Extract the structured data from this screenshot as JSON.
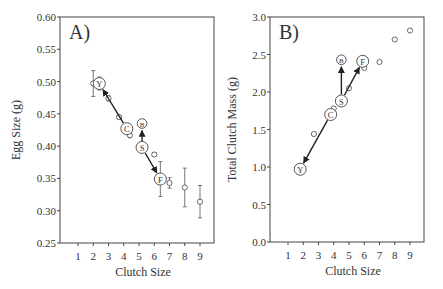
{
  "chart_data": [
    {
      "type": "scatter",
      "panel_label": "A)",
      "title": "",
      "xlabel": "Clutch Size",
      "ylabel": "Egg Size (g)",
      "xlim": [
        0,
        10
      ],
      "ylim": [
        0.25,
        0.6
      ],
      "x_ticks": [
        "1",
        "2",
        "3",
        "4",
        "5",
        "6",
        "7",
        "8",
        "9"
      ],
      "y_ticks": [
        "0.25",
        "0.30",
        "0.35",
        "0.40",
        "0.45",
        "0.50",
        "0.55",
        "0.60"
      ],
      "grid": false,
      "points": [
        {
          "x": 2.0,
          "y": 0.497,
          "err": 0.02
        },
        {
          "x": 3.0,
          "y": 0.474,
          "err": 0.004
        },
        {
          "x": 3.7,
          "y": 0.445,
          "err": 0.002
        },
        {
          "x": 4.4,
          "y": 0.417,
          "err": 0.004
        },
        {
          "x": 6.0,
          "y": 0.387,
          "err": 0.003
        },
        {
          "x": 7.0,
          "y": 0.343,
          "err": 0.008
        },
        {
          "x": 8.0,
          "y": 0.336,
          "err": 0.03
        },
        {
          "x": 9.0,
          "y": 0.314,
          "err": 0.025
        }
      ],
      "labeled_points": [
        {
          "label": "Y",
          "x": 2.4,
          "y": 0.497,
          "err": 0.01
        },
        {
          "label": "C",
          "x": 4.2,
          "y": 0.427,
          "err": 0.004
        },
        {
          "label": "B",
          "x": 5.2,
          "y": 0.435,
          "err": 0
        },
        {
          "label": "S",
          "x": 5.2,
          "y": 0.398,
          "err": 0
        },
        {
          "label": "F",
          "x": 6.4,
          "y": 0.349,
          "err": 0.027
        }
      ],
      "arrows": [
        {
          "from": "C",
          "to": "Y"
        },
        {
          "from": "S",
          "to": "F"
        },
        {
          "from": "S",
          "to": "B"
        }
      ]
    },
    {
      "type": "scatter",
      "panel_label": "B)",
      "title": "",
      "xlabel": "Clutch Size",
      "ylabel": "Total Clutch Mass (g)",
      "xlim": [
        0,
        10
      ],
      "ylim": [
        0.0,
        3.0
      ],
      "x_ticks": [
        "1",
        "2",
        "3",
        "4",
        "5",
        "6",
        "7",
        "8",
        "9"
      ],
      "y_ticks": [
        "0.0",
        "0.5",
        "1.0",
        "1.5",
        "2.0",
        "2.5",
        "3.0"
      ],
      "grid": false,
      "points": [
        {
          "x": 2.7,
          "y": 1.44
        },
        {
          "x": 4.0,
          "y": 1.78
        },
        {
          "x": 5.0,
          "y": 2.05
        },
        {
          "x": 6.0,
          "y": 2.32
        },
        {
          "x": 7.0,
          "y": 2.4
        },
        {
          "x": 8.0,
          "y": 2.7
        },
        {
          "x": 9.0,
          "y": 2.82
        }
      ],
      "labeled_points": [
        {
          "label": "Y",
          "x": 1.8,
          "y": 0.97
        },
        {
          "label": "C",
          "x": 3.8,
          "y": 1.7
        },
        {
          "label": "S",
          "x": 4.5,
          "y": 1.88
        },
        {
          "label": "B",
          "x": 4.5,
          "y": 2.43
        },
        {
          "label": "F",
          "x": 5.9,
          "y": 2.41
        }
      ],
      "arrows": [
        {
          "from": "C",
          "to": "Y"
        },
        {
          "from": "S",
          "to": "F"
        },
        {
          "from": "S",
          "to": "B"
        }
      ]
    }
  ]
}
